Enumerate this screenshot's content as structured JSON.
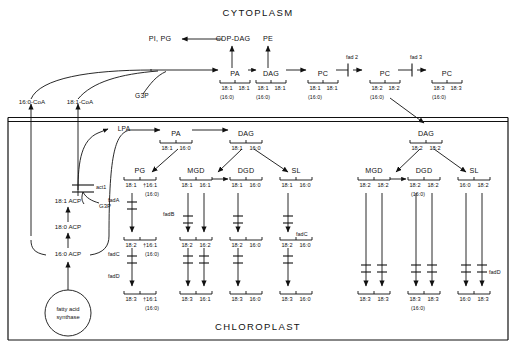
{
  "figure": {
    "type": "biochemical-pathway-diagram",
    "title_top": "CYTOPLASM",
    "title_bottom": "CHLOROPLAST",
    "ink_color": "#111111",
    "background": "#ffffff"
  },
  "cytoplasm": {
    "label": "CYTOPLASM",
    "pi_pg": "PI, PG",
    "cdp_dag": "CDP-DAG",
    "pe": "PE",
    "g3p": "G3P",
    "acyl_pool": {
      "c16_coa": "16:0-CoA",
      "c18_coa": "18:1-CoA"
    },
    "chain": [
      {
        "name": "PA",
        "sn1": "18:1",
        "sn2": "18:1",
        "alt": "(16:0)"
      },
      {
        "name": "DAG",
        "sn1": "18:1",
        "sn2": "18:1",
        "alt": "(16:0)"
      },
      {
        "name": "PC",
        "sn1": "18:1",
        "sn2": "18:1",
        "alt": "(16:0)"
      },
      {
        "name": "PC",
        "sn1": "18:2",
        "sn2": "18:2",
        "alt": "(16:0)"
      },
      {
        "name": "PC",
        "sn1": "18:3",
        "sn2": "18:3",
        "alt": "(16:0)"
      }
    ],
    "desaturases": [
      {
        "label": "fad 2"
      },
      {
        "label": "fad 3"
      }
    ]
  },
  "chloroplast": {
    "label": "CHLOROPLAST",
    "lpa": "LPA",
    "act1": "act1",
    "g3p_inner": "G3P",
    "fas": {
      "line1": "fatty acid",
      "line2": "synthase"
    },
    "acp_ladder": [
      {
        "label": "18:1 ACP"
      },
      {
        "label": "18:0 ACP"
      },
      {
        "label": "16:0 ACP"
      }
    ],
    "prokaryotic": {
      "pa": {
        "name": "PA",
        "sn1": "18:1",
        "sn2": "16:0"
      },
      "dag": {
        "name": "DAG",
        "sn1": "18:1",
        "sn2": "16:0"
      },
      "columns": [
        {
          "name": "PG",
          "rows": [
            {
              "sn1": "18:1",
              "sn2": "†16:1",
              "alt": "(16:0)"
            },
            {
              "sn1": "18:2",
              "sn2": "†16:1",
              "alt": "(16:0)"
            },
            {
              "sn1": "18:3",
              "sn2": "†16:1",
              "alt": "(16:0)"
            }
          ],
          "genes": [
            "fadA",
            "fadC",
            "fadD"
          ]
        },
        {
          "name": "MGD",
          "rows": [
            {
              "sn1": "18:1",
              "sn2": "16:1",
              "alt": ""
            },
            {
              "sn1": "18:2",
              "sn2": "16:2",
              "alt": ""
            },
            {
              "sn1": "18:3",
              "sn2": "16:1",
              "alt": ""
            }
          ],
          "genes": [
            "fadB"
          ]
        },
        {
          "name": "DGD",
          "rows": [
            {
              "sn1": "18:1",
              "sn2": "16:0",
              "alt": ""
            },
            {
              "sn1": "18:2",
              "sn2": "16:0",
              "alt": ""
            },
            {
              "sn1": "18:3",
              "sn2": "16:0",
              "alt": ""
            }
          ],
          "genes": []
        },
        {
          "name": "SL",
          "rows": [
            {
              "sn1": "18:1",
              "sn2": "16:0",
              "alt": ""
            },
            {
              "sn1": "18:2",
              "sn2": "16:0",
              "alt": ""
            },
            {
              "sn1": "18:3",
              "sn2": "16:0",
              "alt": ""
            }
          ],
          "genes": [
            "fadC"
          ]
        }
      ]
    },
    "eukaryotic": {
      "dag": {
        "name": "DAG",
        "sn1": "18:2",
        "sn2": "18:2"
      },
      "columns": [
        {
          "name": "MGD",
          "rows": [
            {
              "sn1": "18:2",
              "sn2": "18:2",
              "alt": ""
            },
            {
              "sn1": "18:3",
              "sn2": "18:3",
              "alt": ""
            }
          ],
          "genes": []
        },
        {
          "name": "DGD",
          "rows": [
            {
              "sn1": "18:2",
              "sn2": "18:2",
              "alt": "(16:0)"
            },
            {
              "sn1": "18:3",
              "sn2": "18:3",
              "alt": "(16:0)"
            }
          ],
          "genes": []
        },
        {
          "name": "SL",
          "rows": [
            {
              "sn1": "16:0",
              "sn2": "18:2",
              "alt": ""
            },
            {
              "sn1": "16:0",
              "sn2": "18:3",
              "alt": ""
            }
          ],
          "genes": [
            "fadD"
          ]
        }
      ]
    }
  }
}
